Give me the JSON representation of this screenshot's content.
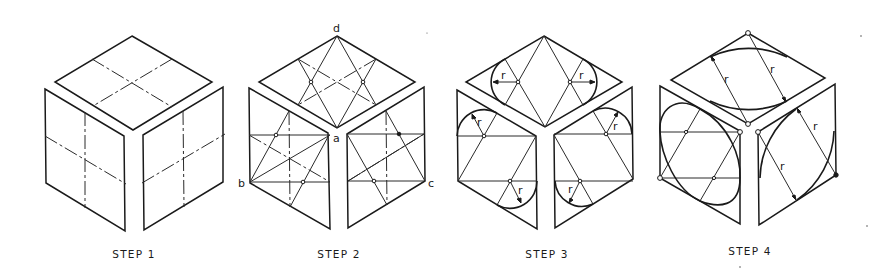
{
  "figure": {
    "steps": [
      {
        "label": "STEP 1",
        "center_x": 134
      },
      {
        "label": "STEP 2",
        "center_x": 339
      },
      {
        "label": "STEP 3",
        "center_x": 547
      },
      {
        "label": "STEP 4",
        "center_x": 750
      }
    ],
    "point_labels": {
      "a": "a",
      "b": "b",
      "c": "c",
      "d": "d"
    },
    "radius_label": "r",
    "colors": {
      "line": "#1a1a1a",
      "background": "#ffffff"
    }
  }
}
